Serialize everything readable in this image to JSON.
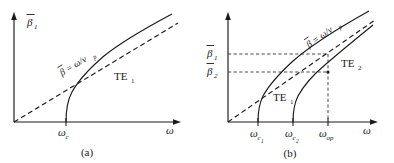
{
  "figure": {
    "panels": [
      {
        "id": "a",
        "caption": "(a)",
        "y_axis_label": "β",
        "y_axis_label_sub": "1",
        "x_axis_label": "ω",
        "asymptote_formula": "β = ω/v",
        "asymptote_formula_sub": "p",
        "curves": [
          {
            "name": "TE",
            "sub": "1",
            "cutoff_label": "ω",
            "cutoff_sub": "c"
          }
        ],
        "x_ticks": [
          {
            "label": "ω",
            "sub": "c",
            "subsub": ""
          }
        ],
        "y_ticks": []
      },
      {
        "id": "b",
        "caption": "(b)",
        "y_axis_label": "β",
        "y_axis_label_sub": "",
        "x_axis_label": "ω",
        "asymptote_formula": "β = ω/v",
        "asymptote_formula_sub": "p",
        "curves": [
          {
            "name": "TE",
            "sub": "1",
            "cutoff_label": "ω",
            "cutoff_sub": "c",
            "cutoff_subsub": "1"
          },
          {
            "name": "TE",
            "sub": "2",
            "cutoff_label": "ω",
            "cutoff_sub": "c",
            "cutoff_subsub": "2"
          }
        ],
        "x_ticks": [
          {
            "label": "ω",
            "sub": "c",
            "subsub": "1"
          },
          {
            "label": "ω",
            "sub": "c",
            "subsub": "2"
          },
          {
            "label": "ω",
            "sub": "op",
            "subsub": ""
          }
        ],
        "y_ticks": [
          {
            "label": "β",
            "sub": "1"
          },
          {
            "label": "β",
            "sub": "2"
          }
        ]
      }
    ],
    "colors": {
      "ink": "#1a1a1a",
      "background": "#ffffff"
    }
  }
}
